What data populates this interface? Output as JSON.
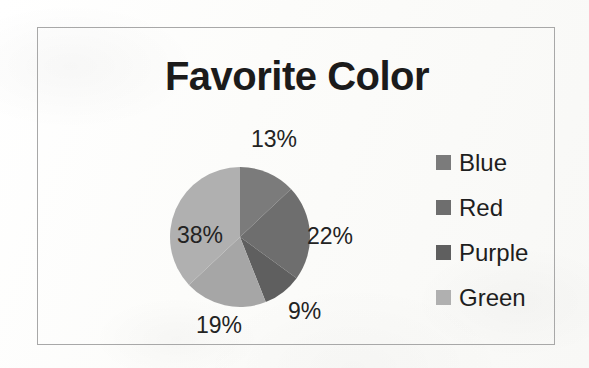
{
  "chart_data": {
    "type": "pie",
    "title": "Favorite Color",
    "categories": [
      "Blue",
      "Red",
      "Purple",
      "Green"
    ],
    "values": [
      13,
      22,
      9,
      19
    ],
    "labels": [
      "13%",
      "22%",
      "9%",
      "19%",
      "38%"
    ],
    "slices": [
      {
        "label": "Blue",
        "percent": 13,
        "percent_label": "13%",
        "color": "#7b7b7b",
        "start_deg": 0,
        "end_deg": 46.8
      },
      {
        "label": "Red",
        "percent": 22,
        "percent_label": "22%",
        "color": "#6e6e6e",
        "start_deg": 46.8,
        "end_deg": 126.0
      },
      {
        "label": "Purple",
        "percent": 9,
        "percent_label": "9%",
        "color": "#5f5f5f",
        "start_deg": 126.0,
        "end_deg": 158.4
      },
      {
        "label": "Green",
        "percent": 19,
        "percent_label": "19%",
        "color": "#a6a6a6",
        "start_deg": 158.4,
        "end_deg": 226.8
      },
      {
        "label": "Green",
        "percent": 38,
        "percent_label": "38%",
        "color": "#b0b0b0",
        "start_deg": 226.8,
        "end_deg": 360.0
      }
    ],
    "legend_position": "right",
    "grid": false,
    "xlabel": "",
    "ylabel": ""
  },
  "chart": {
    "title": "Favorite Color",
    "labels": {
      "blue": "13%",
      "red": "22%",
      "purple": "9%",
      "green_lower": "19%",
      "green_left": "38%"
    }
  },
  "legend": {
    "items": [
      {
        "label": "Blue",
        "swatch_color": "#7b7b7b"
      },
      {
        "label": "Red",
        "swatch_color": "#6e6e6e"
      },
      {
        "label": "Purple",
        "swatch_color": "#5f5f5f"
      },
      {
        "label": "Green",
        "swatch_color": "#b0b0b0"
      }
    ]
  },
  "colors": {
    "frame_border": "#a8a8a8",
    "page_background": "#fdfdfb",
    "text": "#1e1e1e"
  }
}
